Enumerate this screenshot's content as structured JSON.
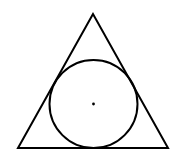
{
  "diagram": {
    "colors": {
      "stroke": "#000000",
      "background": "#ffffff"
    },
    "triangle": {
      "points": [
        [
          93,
          14
        ],
        [
          18,
          148
        ],
        [
          168,
          148
        ]
      ],
      "stroke_width": 2
    },
    "circle": {
      "cx": 93.5,
      "cy": 104,
      "r": 44,
      "stroke_width": 2
    },
    "center_point": {
      "cx": 93.5,
      "cy": 104,
      "r": 1.4
    }
  }
}
